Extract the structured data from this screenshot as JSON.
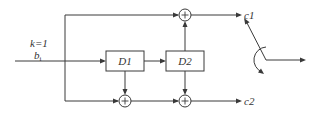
{
  "diagram": {
    "type": "convolutional-encoder",
    "input": {
      "label_k": "k=1",
      "label_b": "b",
      "label_b_sub": "i"
    },
    "registers": [
      {
        "id": "D1",
        "label": "D1"
      },
      {
        "id": "D2",
        "label": "D2"
      }
    ],
    "adders": [
      {
        "id": "top-adder",
        "symbol": "+"
      },
      {
        "id": "bottom-adder-1",
        "symbol": "+"
      },
      {
        "id": "bottom-adder-2",
        "symbol": "+"
      }
    ],
    "outputs": [
      {
        "id": "c1",
        "label": "c1"
      },
      {
        "id": "c2",
        "label": "c2"
      }
    ],
    "switch": {
      "type": "commutator",
      "icon": "rotating-switch-icon"
    }
  }
}
